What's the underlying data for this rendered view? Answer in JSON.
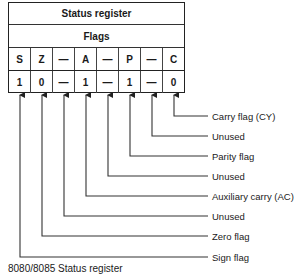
{
  "register": {
    "title": "Status register",
    "subtitle": "Flags",
    "bit_names": [
      "S",
      "Z",
      "—",
      "A",
      "—",
      "P",
      "—",
      "C"
    ],
    "bit_values": [
      "1",
      "0",
      "—",
      "1",
      "—",
      "1",
      "—",
      "0"
    ]
  },
  "labels": [
    "Carry flag (CY)",
    "Unused",
    "Parity flag",
    "Unused",
    "Auxiliary carry (AC)",
    "Unused",
    "Zero flag",
    "Sign flag"
  ],
  "caption": "8080/8085 Status register"
}
